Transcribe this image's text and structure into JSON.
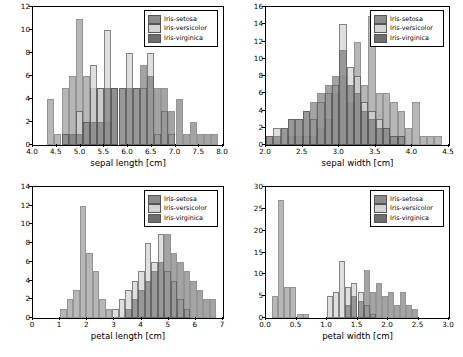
{
  "colors": {
    "setosa": "#8c8c8c",
    "versicolor": "#d4d4d4",
    "virginica": "#6e6e6e",
    "edge": "#555555",
    "axis": "#000000",
    "background": "#ffffff"
  },
  "legend": {
    "setosa": "Iris-setosa",
    "versicolor": "Iris-versicolor",
    "virginica": "Iris-virginica"
  },
  "chart_data": [
    {
      "type": "bar",
      "id": "sepal-length",
      "title": "",
      "xlabel": "sepal length [cm]",
      "ylabel": "",
      "xlim": [
        4.0,
        8.0
      ],
      "ylim": [
        0,
        12
      ],
      "xticks": [
        "4.0",
        "4.5",
        "5.0",
        "5.5",
        "6.0",
        "6.5",
        "7.0",
        "7.5",
        "8.0"
      ],
      "yticks": [
        "0",
        "2",
        "4",
        "6",
        "8",
        "10",
        "12"
      ],
      "grid": false,
      "legend_position": "top-right",
      "bin_edges": [
        4.3,
        4.45,
        4.6,
        4.75,
        4.9,
        5.05,
        5.2,
        5.35,
        5.5,
        5.65,
        5.8,
        5.95,
        6.1,
        6.25,
        6.4,
        6.55,
        6.7,
        6.85,
        7.0,
        7.15,
        7.3,
        7.45,
        7.6,
        7.75,
        7.9
      ],
      "series": [
        {
          "name": "Iris-setosa",
          "values": [
            4,
            1,
            5,
            6,
            11,
            6,
            5,
            5,
            2,
            5,
            0,
            0,
            0,
            0,
            0,
            0,
            0,
            0,
            0,
            0,
            0,
            0,
            0,
            0
          ]
        },
        {
          "name": "Iris-versicolor",
          "values": [
            0,
            0,
            1,
            0,
            3,
            2,
            7,
            5,
            10,
            5,
            5,
            8,
            5,
            5,
            8,
            1,
            3,
            1,
            0,
            0,
            0,
            0,
            0,
            0
          ]
        },
        {
          "name": "Iris-virginica",
          "values": [
            0,
            0,
            1,
            1,
            1,
            2,
            2,
            2,
            5,
            5,
            5,
            5,
            5,
            7,
            6,
            5,
            5,
            3,
            4,
            1,
            2,
            1,
            1,
            1
          ]
        }
      ]
    },
    {
      "type": "bar",
      "id": "sepal-width",
      "title": "",
      "xlabel": "sepal width [cm]",
      "ylabel": "",
      "xlim": [
        2.0,
        4.5
      ],
      "ylim": [
        0,
        16
      ],
      "xticks": [
        "2.0",
        "2.5",
        "3.0",
        "3.5",
        "4.0",
        "4.5"
      ],
      "yticks": [
        "0",
        "2",
        "4",
        "6",
        "8",
        "10",
        "12",
        "14",
        "16"
      ],
      "grid": false,
      "legend_position": "top-right",
      "bin_edges": [
        2.0,
        2.1,
        2.2,
        2.3,
        2.4,
        2.5,
        2.6,
        2.7,
        2.8,
        2.9,
        3.0,
        3.1,
        3.2,
        3.3,
        3.4,
        3.5,
        3.6,
        3.7,
        3.8,
        3.9,
        4.0,
        4.1,
        4.2,
        4.3,
        4.4
      ],
      "series": [
        {
          "name": "Iris-setosa",
          "values": [
            0,
            0,
            0,
            1,
            1,
            1,
            1,
            2,
            3,
            6,
            8,
            5,
            12,
            7,
            15,
            6,
            6,
            5,
            4,
            2,
            5,
            1,
            1,
            1,
            1
          ]
        },
        {
          "name": "Iris-versicolor",
          "values": [
            1,
            2,
            2,
            3,
            3,
            4,
            3,
            5,
            6,
            7,
            14,
            9,
            8,
            5,
            4,
            3,
            2,
            1,
            1,
            0,
            0,
            0,
            0,
            0,
            0
          ]
        },
        {
          "name": "Iris-virginica",
          "values": [
            1,
            1,
            2,
            3,
            3,
            4,
            5,
            6,
            7,
            8,
            11,
            7,
            6,
            4,
            3,
            2,
            2,
            1,
            1,
            0,
            0,
            0,
            0,
            0,
            0
          ]
        }
      ]
    },
    {
      "type": "bar",
      "id": "petal-length",
      "title": "",
      "xlabel": "petal length [cm]",
      "ylabel": "",
      "xlim": [
        0,
        7
      ],
      "ylim": [
        0,
        14
      ],
      "xticks": [
        "0",
        "1",
        "2",
        "3",
        "4",
        "5",
        "6",
        "7"
      ],
      "yticks": [
        "0",
        "2",
        "4",
        "6",
        "8",
        "10",
        "12",
        "14"
      ],
      "grid": false,
      "legend_position": "top-right",
      "bin_edges": [
        1.0,
        1.24,
        1.48,
        1.72,
        1.96,
        2.2,
        2.44,
        2.68,
        2.92,
        3.16,
        3.4,
        3.64,
        3.88,
        4.12,
        4.36,
        4.6,
        4.84,
        5.08,
        5.32,
        5.56,
        5.8,
        6.04,
        6.28,
        6.52,
        6.76
      ],
      "series": [
        {
          "name": "Iris-setosa",
          "values": [
            1,
            2,
            3,
            12,
            7,
            5,
            2,
            1,
            0,
            0,
            0,
            0,
            0,
            0,
            0,
            0,
            0,
            0,
            0,
            0,
            0,
            0,
            0,
            0
          ]
        },
        {
          "name": "Iris-versicolor",
          "values": [
            0,
            0,
            0,
            0,
            0,
            0,
            0,
            0,
            1,
            2,
            3,
            4,
            5,
            8,
            6,
            9,
            5,
            4,
            2,
            1,
            0,
            0,
            0,
            0
          ]
        },
        {
          "name": "Iris-virginica",
          "values": [
            0,
            0,
            0,
            0,
            0,
            0,
            0,
            0,
            0,
            0,
            1,
            2,
            3,
            4,
            5,
            6,
            9,
            7,
            6,
            5,
            4,
            3,
            2,
            2
          ]
        }
      ]
    },
    {
      "type": "bar",
      "id": "petal-width",
      "title": "",
      "xlabel": "petal width [cm]",
      "ylabel": "",
      "xlim": [
        0,
        3.0
      ],
      "ylim": [
        0,
        30
      ],
      "xticks": [
        "0.0",
        "0.5",
        "1.0",
        "1.5",
        "2.0",
        "2.5",
        "3.0"
      ],
      "yticks": [
        "0",
        "5",
        "10",
        "15",
        "20",
        "25",
        "30"
      ],
      "grid": false,
      "legend_position": "top-right",
      "bin_edges": [
        0.1,
        0.2,
        0.3,
        0.4,
        0.5,
        0.6,
        0.7,
        0.8,
        0.9,
        1.0,
        1.1,
        1.2,
        1.3,
        1.4,
        1.5,
        1.6,
        1.7,
        1.8,
        1.9,
        2.0,
        2.1,
        2.2,
        2.3,
        2.4,
        2.5
      ],
      "series": [
        {
          "name": "Iris-setosa",
          "values": [
            5,
            27,
            7,
            7,
            1,
            1,
            0,
            0,
            0,
            0,
            0,
            0,
            0,
            0,
            0,
            0,
            0,
            0,
            0,
            0,
            0,
            0,
            0,
            0
          ]
        },
        {
          "name": "Iris-versicolor",
          "values": [
            0,
            0,
            0,
            0,
            0,
            0,
            0,
            0,
            0,
            5,
            6,
            13,
            7,
            8,
            6,
            3,
            1,
            0,
            0,
            0,
            0,
            0,
            0,
            0
          ]
        },
        {
          "name": "Iris-virginica",
          "values": [
            0,
            0,
            0,
            0,
            0,
            0,
            0,
            0,
            0,
            0,
            0,
            0,
            3,
            5,
            4,
            11,
            6,
            8,
            5,
            6,
            3,
            6,
            3,
            2
          ]
        }
      ]
    }
  ]
}
